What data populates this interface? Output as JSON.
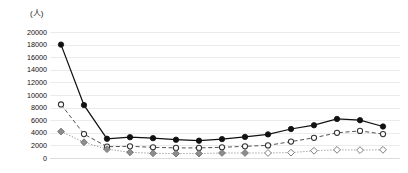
{
  "chart_data": {
    "type": "line",
    "title": "",
    "subtitle": "",
    "xlabel": "",
    "ylabel": "(人)",
    "ylim": [
      0,
      20000
    ],
    "ytick_step": 2000,
    "yticks": [
      20000,
      18000,
      16000,
      14000,
      12000,
      10000,
      8000,
      6000,
      4000,
      2000,
      0
    ],
    "ytick_labels": [
      "20000",
      "18000",
      "16000",
      "14000",
      "12000",
      "10000",
      "8000",
      "6000",
      "4000",
      "2000",
      "0"
    ],
    "grid": true,
    "grid_color": "#ebebeb",
    "legend": "none",
    "x": [
      1,
      2,
      3,
      4,
      5,
      6,
      7,
      8,
      9,
      10,
      11,
      12,
      13,
      14,
      15
    ],
    "categories": [
      "1",
      "2",
      "3",
      "4",
      "5",
      "6",
      "7",
      "8",
      "9",
      "10",
      "11",
      "12",
      "13",
      "14",
      "15"
    ],
    "series": [
      {
        "name": "series-1",
        "marker": "filled-circle",
        "line_style": "solid",
        "color": "#111111",
        "marker_fill": "#111111",
        "marker_stroke": "#111111",
        "values": [
          18000,
          8400,
          3050,
          3300,
          3150,
          2900,
          2750,
          3000,
          3350,
          3750,
          4600,
          5200,
          6200,
          6000,
          5000
        ]
      },
      {
        "name": "series-2",
        "marker": "open-circle",
        "line_style": "dashed",
        "color": "#4a4a4a",
        "marker_fill": "#ffffff",
        "marker_stroke": "#333333",
        "values": [
          8500,
          3800,
          1800,
          1850,
          1700,
          1600,
          1600,
          1700,
          1850,
          2000,
          2600,
          3200,
          4000,
          4300,
          3800
        ]
      },
      {
        "name": "series-3",
        "marker": "diamond",
        "line_style": "dotted",
        "color": "#8a8a8a",
        "marker_fill": "#8d8d8d",
        "marker_stroke": "#6f6f6f",
        "marker_fill_late": "#ffffff",
        "values": [
          4200,
          2500,
          1400,
          900,
          750,
          700,
          700,
          800,
          800,
          800,
          850,
          1150,
          1300,
          1250,
          1300
        ]
      }
    ]
  },
  "colors": {
    "background": "#ffffff",
    "grid": "#ebebeb",
    "text": "#111111",
    "series_1": "#111111",
    "series_2": "#333333",
    "series_3": "#8d8d8d"
  }
}
